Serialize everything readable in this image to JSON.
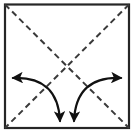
{
  "figure": {
    "canvas": {
      "width": 134,
      "height": 136,
      "background": "#ffffff"
    }
  },
  "style": {
    "outline_color": "#262626",
    "outline_width": 2.2,
    "crease_color": "#3a3a3a",
    "crease_width": 2.0,
    "crease_dash": "6 4",
    "arrow_color": "#111111",
    "arrow_width": 2.2
  },
  "chart_data": {
    "type": "diagram",
    "shapes": [
      {
        "name": "paper-square",
        "kind": "rect",
        "x": 5,
        "y": 4.5,
        "width": 124,
        "height": 123.5,
        "stroke": "#262626",
        "fill": "none",
        "line_style": "solid"
      },
      {
        "name": "crease-diagonal-tl-br",
        "kind": "line",
        "from": [
          5,
          4.5
        ],
        "to": [
          129,
          128
        ],
        "stroke": "#3a3a3a",
        "line_style": "dashed"
      },
      {
        "name": "crease-diagonal-tr-bl",
        "kind": "line",
        "from": [
          129,
          4.5
        ],
        "to": [
          5,
          128
        ],
        "stroke": "#3a3a3a",
        "line_style": "dashed"
      },
      {
        "name": "fold-arrow-left",
        "kind": "curved-arrow",
        "double_headed": true,
        "path": "M 13,78 Q 58,76 60,121",
        "head_start": {
          "at": [
            13,
            78
          ],
          "direction": "left"
        },
        "head_end": {
          "at": [
            60,
            121
          ],
          "direction": "down"
        },
        "stroke": "#111111"
      },
      {
        "name": "fold-arrow-right",
        "kind": "curved-arrow",
        "double_headed": true,
        "path": "M 74,121 Q 76,76 121,78",
        "head_start": {
          "at": [
            74,
            121
          ],
          "direction": "down"
        },
        "head_end": {
          "at": [
            121,
            78
          ],
          "direction": "right"
        },
        "stroke": "#111111"
      }
    ],
    "labels": [],
    "annotations": []
  }
}
